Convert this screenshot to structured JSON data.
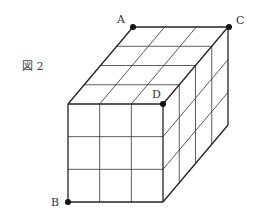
{
  "figure_label": "図 2",
  "points": {
    "A": {
      "label": "A",
      "x": 133,
      "y": 27
    },
    "C": {
      "label": "C",
      "x": 229,
      "y": 27
    },
    "D": {
      "label": "D",
      "x": 163,
      "y": 104
    },
    "B": {
      "label": "B",
      "x": 68,
      "y": 202
    }
  },
  "cuboid": {
    "width_units": 3,
    "height_units": 3,
    "depth_units": 4,
    "front_face": {
      "x0": 68,
      "y0": 104,
      "x1": 163,
      "y1": 202
    },
    "depth_offset": {
      "dx": 65,
      "dy": -77
    }
  },
  "colors": {
    "line": "#333333",
    "point": "#111111"
  }
}
